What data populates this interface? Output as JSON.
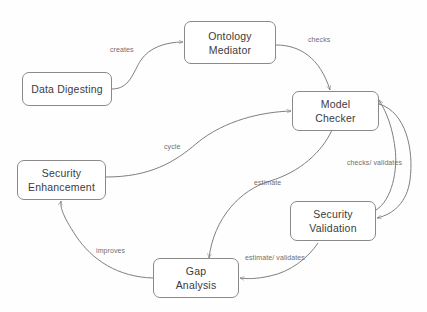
{
  "diagram": {
    "type": "flowchart",
    "background_color": "#fefefe",
    "node_border_color": "#8a8a8a",
    "node_text_color": "#3b3b3b",
    "edge_color": "#7f7f7f",
    "edge_label_color": "#6f6f6f",
    "nodes": [
      {
        "id": "data-digesting",
        "line1": "Data Digesting",
        "line2": ""
      },
      {
        "id": "ontology-mediator",
        "line1": "Ontology",
        "line2": "Mediator"
      },
      {
        "id": "model-checker",
        "line1": "Model",
        "line2": "Checker"
      },
      {
        "id": "security-enhancement",
        "line1": "Security",
        "line2": "Enhancement"
      },
      {
        "id": "security-validation",
        "line1": "Security",
        "line2": "Validation"
      },
      {
        "id": "gap-analysis",
        "line1": "Gap",
        "line2": "Analysis"
      }
    ],
    "edges": [
      {
        "id": "creates",
        "label": "creates",
        "from": "data-digesting",
        "to": "ontology-mediator"
      },
      {
        "id": "checks",
        "label": "checks",
        "from": "ontology-mediator",
        "to": "model-checker"
      },
      {
        "id": "cycle",
        "label": "cycle",
        "from": "security-enhancement",
        "to": "model-checker"
      },
      {
        "id": "checks-validates",
        "label": "checks/ validates",
        "from": "model-checker",
        "to": "security-validation"
      },
      {
        "id": "estimate",
        "label": "estimate",
        "from": "model-checker",
        "to": "gap-analysis"
      },
      {
        "id": "estimate-validates",
        "label": "estimate/ validates",
        "from": "security-validation",
        "to": "gap-analysis"
      },
      {
        "id": "improves",
        "label": "improves",
        "from": "gap-analysis",
        "to": "security-enhancement"
      }
    ]
  }
}
